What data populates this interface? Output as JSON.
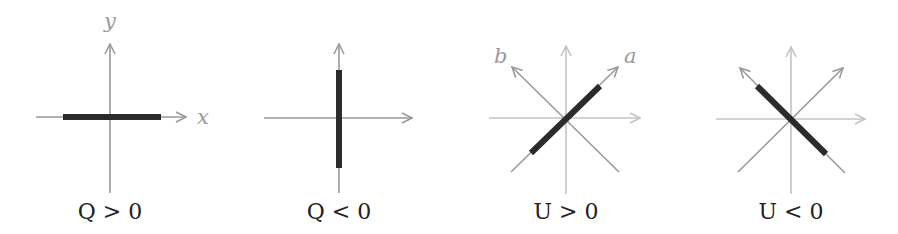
{
  "panels": [
    {
      "caption": "Q > 0",
      "axis_labels": {
        "x": "x",
        "y": "y"
      },
      "polarization": "horizontal"
    },
    {
      "caption": "Q < 0",
      "axis_labels": {},
      "polarization": "vertical"
    },
    {
      "caption": "U > 0",
      "axis_labels": {
        "a": "a",
        "b": "b"
      },
      "polarization": "diagonal along a (+45°)"
    },
    {
      "caption": "U < 0",
      "axis_labels": {},
      "polarization": "diagonal along b (-45°)"
    }
  ],
  "colors": {
    "axis": "#9a9a9a",
    "axis_faint": "#c4c4c4",
    "bar": "#2b2b2b",
    "text": "#222222"
  }
}
